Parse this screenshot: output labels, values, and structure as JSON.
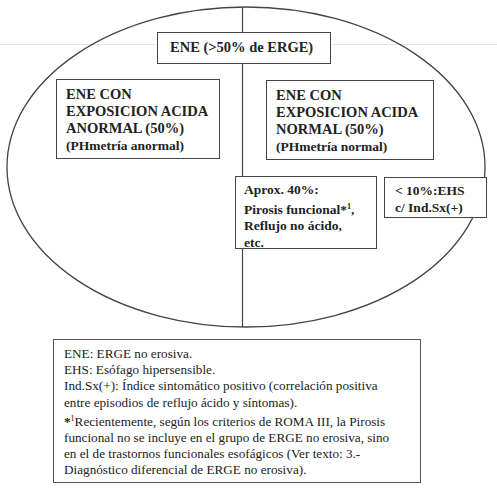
{
  "diagram": {
    "top_box": {
      "label": "ENE (>50% de ERGE)"
    },
    "left_box": {
      "line1": "ENE CON",
      "line2": "EXPOSICION ACIDA",
      "line3": "ANORMAL (50%)",
      "line4": "(PHmetría anormal)"
    },
    "right_box": {
      "line1": "ENE CON",
      "line2": "EXPOSICION ACIDA",
      "line3": "NORMAL (50%)",
      "line4": "(PHmetría normal)"
    },
    "aprox_box": {
      "line1": "Aprox. 40%:",
      "line2": "Pirosis funcional*",
      "line2_sup": "1",
      "line2_end": ",",
      "line3": "Reflujo no ácido,",
      "line4": "etc."
    },
    "ehs_box": {
      "line1": "< 10%:EHS",
      "line2": "c/ Ind.Sx(+)"
    },
    "colors": {
      "stroke": "#444444",
      "background": "#ffffff",
      "text": "#222222"
    }
  },
  "legend": {
    "lines": [
      "ENE: ERGE no erosiva.",
      "EHS: Esófago hipersensible.",
      "Ind.Sx(+): Índice sintomático positivo (correlación positiva",
      "entre episodios de reflujo ácido y síntomas).",
      "Recientemente, según los criterios de ROMA III, la Pirosis",
      "funcional no se incluye en el grupo de ERGE no erosiva, sino",
      "en el de trastornos funcionales esofágicos (Ver texto: 3.-",
      "Diagnóstico diferencial de ERGE no erosiva)."
    ],
    "footnote_marker": "*",
    "footnote_sup": "1"
  }
}
